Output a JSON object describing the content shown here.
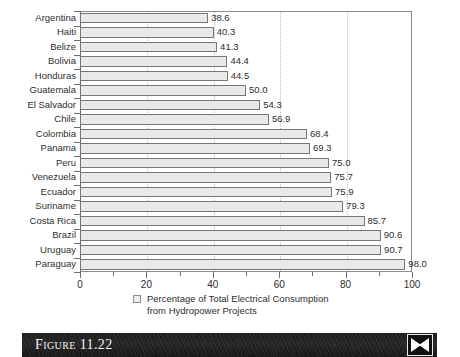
{
  "figure": {
    "caption_label": "Figure 11.22",
    "logo_name": "x-bowtie-logo"
  },
  "legend": {
    "line1": "Percentage of Total Electrical Consumption",
    "line2": "from Hydropower Projects",
    "swatch_color": "#ececec"
  },
  "axis": {
    "x_tick_labels": [
      "0",
      "20",
      "40",
      "60",
      "80",
      "100"
    ],
    "x_tick_values": [
      0,
      20,
      40,
      60,
      80,
      100
    ],
    "x_minor_values": [
      10,
      30,
      50,
      70,
      90
    ],
    "gridline_values": [
      20,
      40,
      60,
      80
    ]
  },
  "chart_data": {
    "type": "bar",
    "orientation": "horizontal",
    "title": "",
    "subtitle": "",
    "xlabel": "Percentage of Total Electrical Consumption from Hydropower Projects",
    "ylabel": "",
    "xlim": [
      0,
      100
    ],
    "grid": true,
    "legend_position": "bottom",
    "legend_entries": [
      "Percentage of Total Electrical Consumption from Hydropower Projects"
    ],
    "categories": [
      "Argentina",
      "Haiti",
      "Belize",
      "Bolivia",
      "Honduras",
      "Guatemala",
      "El Salvador",
      "Chile",
      "Colombia",
      "Panama",
      "Peru",
      "Venezuela",
      "Ecuador",
      "Suriname",
      "Costa Rica",
      "Brazil",
      "Uruguay",
      "Paraguay"
    ],
    "values": [
      38.6,
      40.3,
      41.3,
      44.4,
      44.5,
      50.0,
      54.3,
      56.9,
      68.4,
      69.3,
      75.0,
      75.7,
      75.9,
      79.3,
      85.7,
      90.6,
      90.7,
      98.0
    ],
    "value_labels": [
      "38.6",
      "40.3",
      "41.3",
      "44.4",
      "44.5",
      "50.0",
      "54.3",
      "56.9",
      "68.4",
      "69.3",
      "75.0",
      "75.7",
      "75.9",
      "79.3",
      "85.7",
      "90.6",
      "90.7",
      "98.0"
    ],
    "bar_fill": "#e9e9e9",
    "bar_border": "#777777"
  }
}
